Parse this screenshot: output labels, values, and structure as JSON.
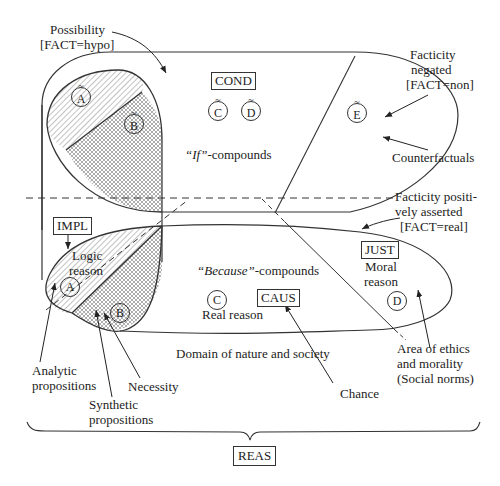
{
  "top_region": {
    "possibility_label": "Possibility",
    "possibility_fact": "[FACT=hypo]",
    "cond_box": "COND",
    "if_compounds_quote": "“If”",
    "if_compounds_suffix": "-compounds",
    "facticity_negated_1": "Facticity",
    "facticity_negated_2": "negated",
    "facticity_negated_fact": "[FACT=non]",
    "counterfactuals": "Counterfactuals",
    "circles": {
      "a": "A",
      "b": "B",
      "c": "C",
      "d": "D",
      "e": "E",
      "tilde": "~"
    }
  },
  "bottom_region": {
    "facticity_positive_1": "Facticity positi-",
    "facticity_positive_2": "vely asserted",
    "facticity_positive_fact": "[FACT=real]",
    "impl_box": "IMPL",
    "logic_reason_1": "Logic",
    "logic_reason_2": "reason",
    "because_quote": "“Because”",
    "because_suffix": "-compounds",
    "caus_box": "CAUS",
    "real_reason": "Real reason",
    "just_box": "JUST",
    "moral_reason_1": "Moral",
    "moral_reason_2": "reason",
    "domain_label": "Domain of nature and society",
    "circles": {
      "a": "A",
      "b": "B",
      "c": "C",
      "d": "D"
    }
  },
  "annotations": {
    "analytic_1": "Analytic",
    "analytic_2": "propositions",
    "synthetic_1": "Synthetic",
    "synthetic_2": "propositions",
    "necessity": "Necessity",
    "chance": "Chance",
    "ethics_1": "Area of ethics",
    "ethics_2": "and morality",
    "ethics_3": "(Social norms)"
  },
  "reas_box": "REAS",
  "colors": {
    "line": "#333333",
    "hatch": "#555555",
    "background": "#ffffff"
  }
}
